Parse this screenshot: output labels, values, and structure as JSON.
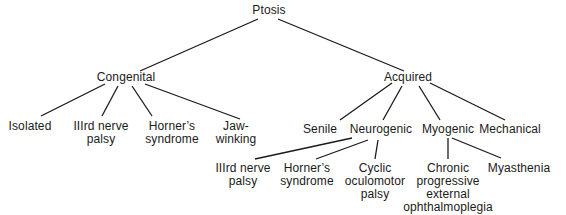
{
  "diagram": {
    "type": "tree",
    "title": "Ptosis",
    "root": {
      "label": "Ptosis",
      "children": [
        {
          "label": "Congenital",
          "children": [
            {
              "label": "Isolated"
            },
            {
              "label": "IIIrd nerve\npalsy"
            },
            {
              "label": "Horner's\nsyndrome"
            },
            {
              "label": "Jaw-\nwinking"
            }
          ]
        },
        {
          "label": "Acquired",
          "children": [
            {
              "label": "Senile"
            },
            {
              "label": "Neurogenic",
              "children": [
                {
                  "label": "IIIrd nerve\npalsy"
                },
                {
                  "label": "Horner's\nsyndrome"
                },
                {
                  "label": "Cyclic\noculomotor\npalsy"
                }
              ]
            },
            {
              "label": "Myogenic",
              "children": [
                {
                  "label": "Chronic\nprogressive\nexternal\nophthalmoplegia"
                },
                {
                  "label": "Myasthenia"
                }
              ]
            },
            {
              "label": "Mechanical"
            }
          ]
        }
      ]
    }
  },
  "nodes": {
    "ptosis": "Ptosis",
    "congenital": "Congenital",
    "acquired": "Acquired",
    "isolated": "Isolated",
    "cong_third_nerve": "IIIrd nerve\npalsy",
    "cong_horners": "Horner’s\nsyndrome",
    "jaw_winking": "Jaw-\nwinking",
    "senile": "Senile",
    "neurogenic": "Neurogenic",
    "myogenic": "Myogenic",
    "mechanical": "Mechanical",
    "neuro_third_nerve": "IIIrd nerve\npalsy",
    "neuro_horners": "Horner’s\nsyndrome",
    "cyclic_oculomotor": "Cyclic\noculomotor\npalsy",
    "cpeo": "Chronic\nprogressive\nexternal\nophthalmoplegia",
    "myasthenia": "Myasthenia"
  },
  "colors": {
    "background": "#ffffff",
    "text": "#1a1a1a",
    "lines": "#1a1a1a"
  }
}
